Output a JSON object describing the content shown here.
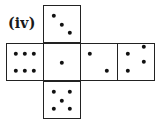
{
  "figure": {
    "label": "(iv)",
    "faces": [
      {
        "id": "top",
        "pips": 3,
        "x": 43,
        "y": 5,
        "dots": [
          [
            10,
            10
          ],
          [
            18,
            19
          ],
          [
            26,
            27
          ]
        ]
      },
      {
        "id": "left",
        "pips": 6,
        "x": 6,
        "y": 43,
        "dots": [
          [
            9,
            10
          ],
          [
            18,
            10
          ],
          [
            27,
            10
          ],
          [
            9,
            27
          ],
          [
            18,
            27
          ],
          [
            27,
            27
          ]
        ]
      },
      {
        "id": "center",
        "pips": 1,
        "x": 43,
        "y": 43,
        "dots": [
          [
            18,
            19
          ]
        ]
      },
      {
        "id": "right",
        "pips": 2,
        "x": 80,
        "y": 43,
        "dots": [
          [
            9,
            10
          ],
          [
            26,
            27
          ]
        ]
      },
      {
        "id": "far-right",
        "pips": 4,
        "x": 117,
        "y": 43,
        "dots": [
          [
            10,
            10
          ],
          [
            10,
            27
          ],
          [
            26,
            3
          ],
          [
            26,
            18
          ]
        ]
      },
      {
        "id": "bottom",
        "pips": 5,
        "x": 43,
        "y": 81,
        "dots": [
          [
            10,
            10
          ],
          [
            26,
            10
          ],
          [
            18,
            19
          ],
          [
            10,
            27
          ],
          [
            26,
            27
          ]
        ]
      }
    ]
  },
  "colors": {
    "border": "#222222",
    "dot": "#111111",
    "background": "#ffffff"
  }
}
